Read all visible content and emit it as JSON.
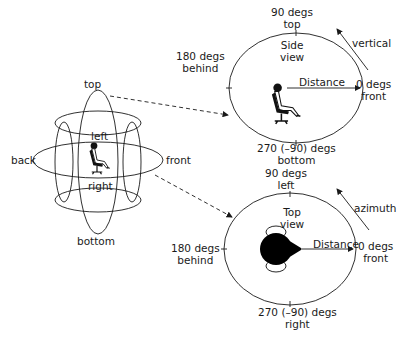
{
  "sphere": {
    "labels": {
      "top": "top",
      "bottom": "bottom",
      "back": "back",
      "front": "front",
      "left": "left",
      "right": "right"
    }
  },
  "side_view": {
    "title_line1": "Side",
    "title_line2": "view",
    "top_deg": "90 degs",
    "top_dir": "top",
    "behind_deg": "180 degs",
    "behind_dir": "behind",
    "front_deg": "0 degs",
    "front_dir": "front",
    "bottom_deg": "270 (–90) degs",
    "bottom_dir": "bottom",
    "distance": "Distance",
    "rotation": "vertical"
  },
  "top_view": {
    "title_line1": "Top",
    "title_line2": "view",
    "top_deg": "90 degs",
    "top_dir": "left",
    "behind_deg": "180 degs",
    "behind_dir": "behind",
    "front_deg": "0 degs",
    "front_dir": "front",
    "bottom_deg": "270 (–90) degs",
    "bottom_dir": "right",
    "distance": "Distance",
    "rotation": "azimuth"
  },
  "colors": {
    "stroke": "#1a1a1a",
    "background": "#ffffff"
  }
}
